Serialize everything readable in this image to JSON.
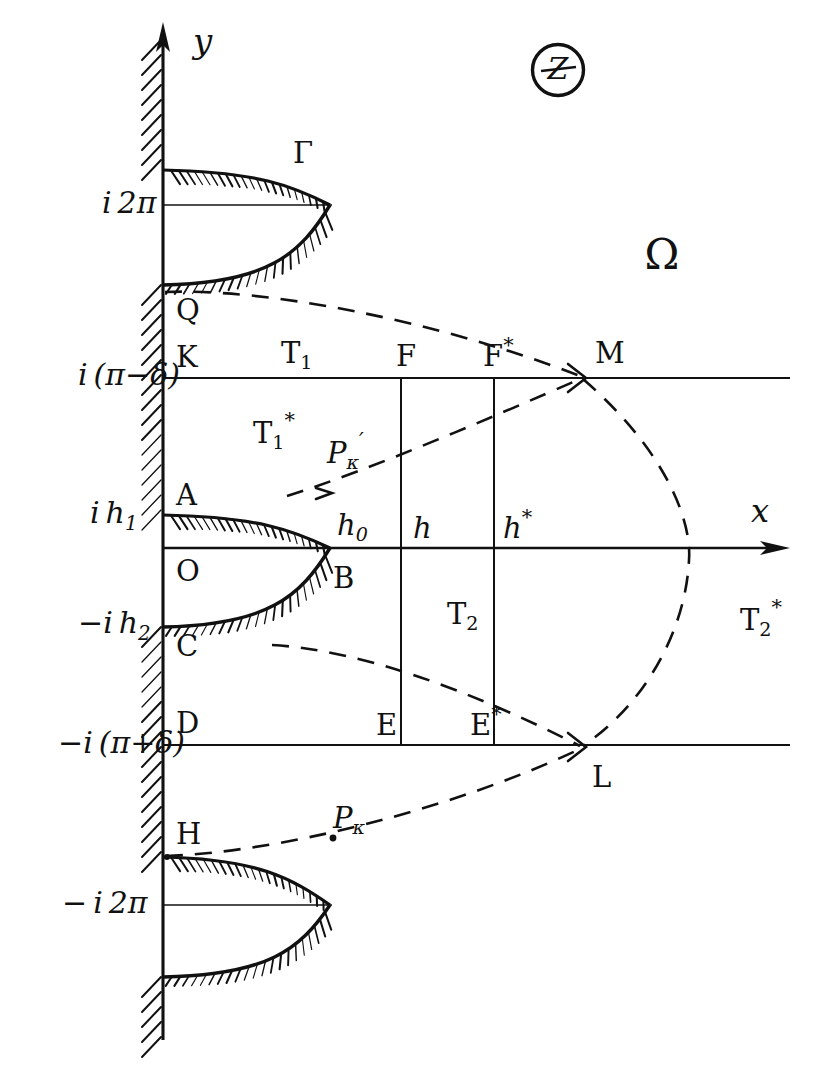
{
  "figure": {
    "plane_label": "Z",
    "region_label": "Ω",
    "axes": {
      "x_label": "x",
      "y_label": "y"
    }
  },
  "axis_ticks": [
    {
      "id": "i2pi",
      "text": "i 2π",
      "x": 102,
      "y": 205
    },
    {
      "id": "ipi-delta",
      "text": "i (π−δ)",
      "x": 78,
      "y": 377
    },
    {
      "id": "ih1",
      "text": "i h",
      "subscript": "1",
      "x": 90,
      "y": 515
    },
    {
      "id": "-ih2",
      "text": "−i h",
      "subscript": "2",
      "x": 78,
      "y": 625
    },
    {
      "id": "-ipi+delta",
      "text": "−i (π+δ)",
      "x": 58,
      "y": 745
    },
    {
      "id": "-i2pi",
      "text": "− i 2π",
      "x": 62,
      "y": 905
    }
  ],
  "point_labels": [
    {
      "id": "Gamma",
      "text": "Γ",
      "x": 293,
      "y": 155
    },
    {
      "id": "Q",
      "text": "Q",
      "x": 176,
      "y": 312
    },
    {
      "id": "K",
      "text": "K",
      "x": 176,
      "y": 359
    },
    {
      "id": "A",
      "text": "A",
      "x": 176,
      "y": 497
    },
    {
      "id": "O",
      "text": "O",
      "x": 176,
      "y": 573
    },
    {
      "id": "C",
      "text": "C",
      "x": 176,
      "y": 648
    },
    {
      "id": "D",
      "text": "D",
      "x": 176,
      "y": 725
    },
    {
      "id": "H",
      "text": "H",
      "x": 176,
      "y": 836
    },
    {
      "id": "B",
      "text": "B",
      "x": 333,
      "y": 580
    },
    {
      "id": "F",
      "text": "F",
      "x": 396,
      "y": 358
    },
    {
      "id": "Fstar",
      "text": "F",
      "superscript": "*",
      "x": 483,
      "y": 358
    },
    {
      "id": "M",
      "text": "M",
      "x": 595,
      "y": 355
    },
    {
      "id": "E",
      "text": "E",
      "x": 376,
      "y": 727
    },
    {
      "id": "Estar",
      "text": "E",
      "superscript": "*",
      "x": 470,
      "y": 727
    },
    {
      "id": "L",
      "text": "L",
      "x": 592,
      "y": 779
    },
    {
      "id": "h0",
      "text": "h",
      "subscript": "0",
      "x": 337,
      "y": 527
    },
    {
      "id": "h",
      "text": "h",
      "x": 413,
      "y": 530
    },
    {
      "id": "hstar",
      "text": "h",
      "superscript": "*",
      "x": 503,
      "y": 530
    },
    {
      "id": "T1",
      "text": "T",
      "subscript": "1",
      "x": 281,
      "y": 355
    },
    {
      "id": "T1star",
      "text": "T",
      "subscript": "1",
      "superscript": "*",
      "x": 253,
      "y": 435
    },
    {
      "id": "T2",
      "text": "T",
      "subscript": "2",
      "x": 447,
      "y": 616
    },
    {
      "id": "T2star",
      "text": "T",
      "subscript": "2",
      "superscript": "*",
      "x": 740,
      "y": 622
    },
    {
      "id": "Pk-prime",
      "text": "P",
      "subscript": "κ",
      "superscript": "′",
      "x": 327,
      "y": 455
    },
    {
      "id": "Pk",
      "text": "P",
      "subscript": "κ",
      "x": 333,
      "y": 820
    }
  ],
  "geometry": {
    "y_axis_x": 163,
    "x_axis_y": 548,
    "axis_color": "#111111",
    "hatch_color": "#111111",
    "dash_color": "#111111",
    "horizontal_lines": [
      {
        "id": "line-i2pi",
        "y": 205,
        "x1": 163,
        "x2": 330
      },
      {
        "id": "line-ipi-delta",
        "y": 378,
        "x1": 163,
        "x2": 790
      },
      {
        "id": "line-x-axis",
        "y": 548,
        "x1": 163,
        "x2": 786
      },
      {
        "id": "line-minus-ipi-delta",
        "y": 745,
        "x1": 163,
        "x2": 790
      },
      {
        "id": "line-minus-i2pi",
        "y": 905,
        "x1": 163,
        "x2": 330
      }
    ],
    "vertical_lines": [
      {
        "id": "line-F",
        "x": 401,
        "y1": 378,
        "y2": 745
      },
      {
        "id": "line-Fstar",
        "x": 494,
        "y1": 378,
        "y2": 745
      }
    ],
    "cusps": [
      {
        "id": "cusp-upper",
        "top_y": 170,
        "tip_x": 330,
        "tip_y": 205,
        "bottom_y": 285
      },
      {
        "id": "cusp-middle",
        "top_y": 515,
        "tip_x": 330,
        "tip_y": 548,
        "bottom_y": 627
      },
      {
        "id": "cusp-lower",
        "top_y": 857,
        "tip_x": 330,
        "tip_y": 905,
        "bottom_y": 977
      }
    ],
    "dashed_curves": [
      {
        "id": "curve-Q-M",
        "from": "Q",
        "to": "M"
      },
      {
        "id": "curve-A-M",
        "from": "Pk-prime-ray",
        "to": "M"
      },
      {
        "id": "curve-M-L",
        "from": "M",
        "to": "L"
      },
      {
        "id": "curve-C-L",
        "from": "C",
        "to": "L"
      },
      {
        "id": "curve-H-L",
        "from": "H",
        "to": "L"
      }
    ]
  }
}
